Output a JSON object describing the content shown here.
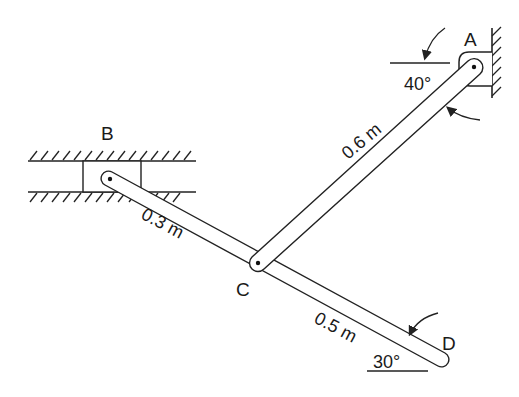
{
  "diagram": {
    "type": "mechanism-linkage",
    "points": {
      "A": {
        "label": "A",
        "role": "fixed pivot on wall"
      },
      "B": {
        "label": "B",
        "role": "slider in horizontal guide"
      },
      "C": {
        "label": "C",
        "role": "pin joint"
      },
      "D": {
        "label": "D",
        "role": "free end"
      }
    },
    "links": [
      {
        "id": "AC",
        "length_label": "0.6 m"
      },
      {
        "id": "BC",
        "length_label": "0.3 m"
      },
      {
        "id": "CD",
        "length_label": "0.5 m"
      }
    ],
    "angles": [
      {
        "at": "A",
        "label": "40°"
      },
      {
        "at": "D",
        "label": "30°"
      }
    ]
  },
  "labels": {
    "A": "A",
    "B": "B",
    "C": "C",
    "D": "D",
    "len_AC": "0.6 m",
    "len_BC": "0.3 m",
    "len_CD": "0.5 m",
    "angle_A": "40°",
    "angle_D": "30°"
  }
}
